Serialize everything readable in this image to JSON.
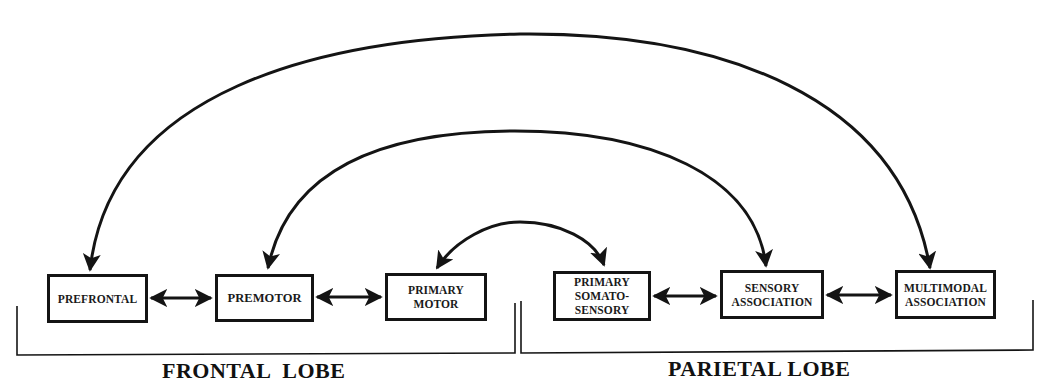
{
  "diagram": {
    "type": "cortical-connectivity-diagram",
    "colors": {
      "line": "#141414",
      "background": "#ffffff"
    },
    "nodes": [
      {
        "id": "prefrontal",
        "lines": [
          "PREFRONTAL"
        ],
        "lobe": "frontal"
      },
      {
        "id": "premotor",
        "lines": [
          "PREMOTOR"
        ],
        "lobe": "frontal"
      },
      {
        "id": "primary_motor",
        "lines": [
          "PRIMARY",
          "MOTOR"
        ],
        "lobe": "frontal"
      },
      {
        "id": "primary_somatosensory",
        "lines": [
          "PRIMARY",
          "SOMATO-",
          "SENSORY"
        ],
        "lobe": "parietal"
      },
      {
        "id": "sensory_association",
        "lines": [
          "SENSORY",
          "ASSOCIATION"
        ],
        "lobe": "parietal"
      },
      {
        "id": "multimodal_association",
        "lines": [
          "MULTIMODAL",
          "ASSOCIATION"
        ],
        "lobe": "parietal"
      }
    ],
    "edges": [
      {
        "from": "prefrontal",
        "to": "premotor",
        "style": "straight-bidirectional"
      },
      {
        "from": "premotor",
        "to": "primary_motor",
        "style": "straight-bidirectional"
      },
      {
        "from": "primary_somatosensory",
        "to": "sensory_association",
        "style": "straight-bidirectional"
      },
      {
        "from": "sensory_association",
        "to": "multimodal_association",
        "style": "straight-bidirectional"
      },
      {
        "from": "primary_motor",
        "to": "primary_somatosensory",
        "style": "arc-bidirectional"
      },
      {
        "from": "premotor",
        "to": "sensory_association",
        "style": "arc-bidirectional"
      },
      {
        "from": "prefrontal",
        "to": "multimodal_association",
        "style": "arc-bidirectional"
      }
    ],
    "groups": [
      {
        "id": "frontal",
        "label": "FRONTAL  LOBE"
      },
      {
        "id": "parietal",
        "label": "PARIETAL LOBE"
      }
    ]
  }
}
